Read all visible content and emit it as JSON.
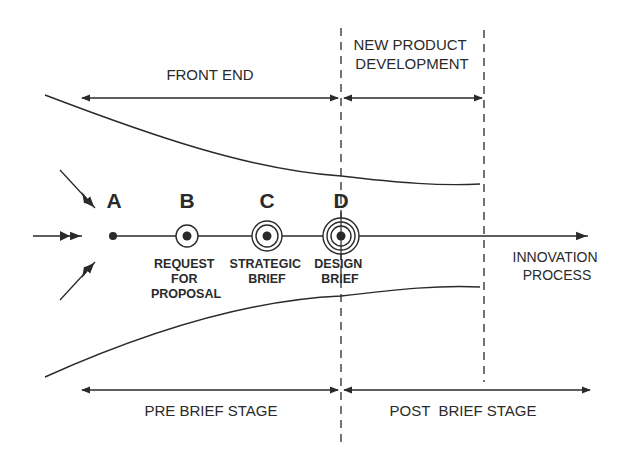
{
  "diagram": {
    "top_phases": [
      {
        "label_lines": [
          "FRONT END"
        ]
      },
      {
        "label_lines": [
          "NEW PRODUCT",
          "DEVELOPMENT"
        ]
      }
    ],
    "bottom_stages": [
      {
        "label": "PRE BRIEF STAGE"
      },
      {
        "label": "POST  BRIEF STAGE"
      }
    ],
    "points": [
      {
        "letter": "A",
        "rings": 0,
        "caption_lines": []
      },
      {
        "letter": "B",
        "rings": 1,
        "caption_lines": [
          "REQUEST",
          "FOR",
          "PROPOSAL"
        ]
      },
      {
        "letter": "C",
        "rings": 2,
        "caption_lines": [
          "STRATEGIC",
          "BRIEF"
        ]
      },
      {
        "letter": "D",
        "rings": 3,
        "caption_lines": [
          "DESIGN",
          "BRIEF"
        ]
      }
    ],
    "axis_label_lines": [
      "INNOVATION",
      "PROCESS"
    ],
    "colors": {
      "ink": "#2a2a2a",
      "background": "#ffffff"
    }
  }
}
